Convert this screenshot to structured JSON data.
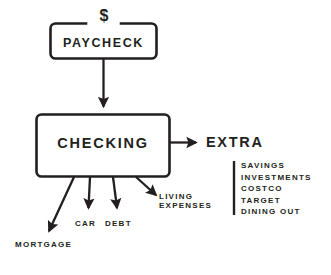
{
  "diagram": {
    "background_color": "#ffffff",
    "stroke_color": "#231f20",
    "nodes": {
      "paycheck": {
        "label": "PAYCHECK",
        "badge": "$",
        "shape": "rounded-rectangle"
      },
      "checking": {
        "label": "CHECKING",
        "shape": "rounded-rectangle"
      },
      "extra": {
        "label": "EXTRA"
      }
    },
    "outflows": [
      {
        "label": "MORTGAGE"
      },
      {
        "label": "CAR"
      },
      {
        "label": "DEBT"
      },
      {
        "label": "LIVING",
        "label_line_2": "EXPENSES"
      }
    ],
    "extra_items": [
      "SAVINGS",
      "INVESTMENTS",
      "COSTCO",
      "TARGET",
      "DINING OUT"
    ],
    "connectors": [
      {
        "name": "paycheck-to-checking",
        "type": "arrow-down"
      },
      {
        "name": "checking-to-extra",
        "type": "arrow-right"
      },
      {
        "name": "checking-to-mortgage",
        "type": "arrow-diagonal-left"
      },
      {
        "name": "checking-to-car",
        "type": "arrow-down"
      },
      {
        "name": "checking-to-debt",
        "type": "arrow-down"
      },
      {
        "name": "checking-to-living-expenses",
        "type": "arrow-diagonal-right"
      }
    ]
  }
}
